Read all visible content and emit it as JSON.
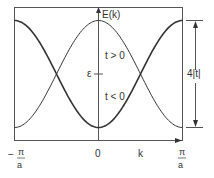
{
  "diagram": {
    "type": "tight-binding band dispersion",
    "y_axis_label": "E(k)",
    "x_axis_label": "k",
    "center_label": "ε",
    "curve_labels": {
      "positive": "t > 0",
      "negative": "t < 0"
    },
    "bandwidth_label": "4|t|",
    "x_ticks": {
      "left": {
        "num": "π",
        "den": "a",
        "sign": "−"
      },
      "center": "0",
      "right": {
        "num": "π",
        "den": "a"
      }
    },
    "colors": {
      "line": "#333333",
      "frame": "#555555",
      "background": "#ffffff"
    }
  }
}
